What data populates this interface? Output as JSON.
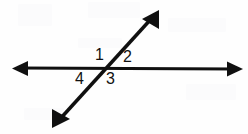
{
  "figure": {
    "name": "intersecting-lines-angle-diagram",
    "width": 248,
    "height": 134,
    "background_color": "#fefefe",
    "stroke_color": "#101010",
    "label_color": "#111111"
  },
  "lines": [
    {
      "name": "horizontal-line",
      "arrowheads": "both",
      "start": {
        "x": 12,
        "y": 68
      },
      "end": {
        "x": 243,
        "y": 69
      },
      "thickness": 3
    },
    {
      "name": "diagonal-line",
      "arrowheads": "both",
      "start": {
        "x": 52,
        "y": 128
      },
      "end": {
        "x": 159,
        "y": 10
      },
      "thickness": 3.5
    }
  ],
  "intersection": {
    "x": 107,
    "y": 68
  },
  "angle_labels": [
    {
      "name": "angle-label-1",
      "text": "1",
      "x": 95,
      "y": 47,
      "position": "upper-left"
    },
    {
      "name": "angle-label-2",
      "text": "2",
      "x": 123,
      "y": 49,
      "position": "upper-right"
    },
    {
      "name": "angle-label-3",
      "text": "3",
      "x": 106,
      "y": 71,
      "position": "lower-right"
    },
    {
      "name": "angle-label-4",
      "text": "4",
      "x": 75,
      "y": 71,
      "position": "lower-left"
    }
  ]
}
